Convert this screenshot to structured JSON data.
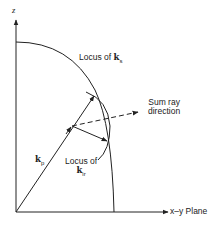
{
  "diagram": {
    "axes": {
      "z_label": "z",
      "xy_label": "x–y Plane"
    },
    "labels": {
      "locus_ks_prefix": "Locus of ",
      "locus_ks_symbol": "k",
      "locus_ks_sub": "s",
      "sum_ray_line1": "Sum ray",
      "sum_ray_line2": "direction",
      "kp_symbol": "k",
      "kp_sub": "p",
      "locus_kir_line1": "Locus of",
      "locus_kir_symbol": "k",
      "locus_kir_sub": "ir"
    },
    "colors": {
      "line": "#222222",
      "background": "#ffffff"
    }
  }
}
